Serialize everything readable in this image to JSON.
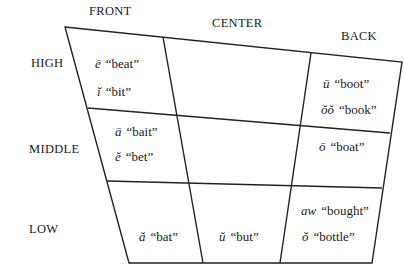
{
  "diagram": {
    "type": "vowel-chart",
    "column_labels": {
      "front": "FRONT",
      "center": "CENTER",
      "back": "BACK"
    },
    "row_labels": {
      "high": "HIGH",
      "middle": "MIDDLE",
      "low": "LOW"
    },
    "cells": {
      "high_front": [
        {
          "symbol": "ē",
          "word": "beat"
        },
        {
          "symbol": "ĭ",
          "word": "bit"
        }
      ],
      "high_center": [],
      "high_back": [
        {
          "symbol": "ū",
          "word": "boot"
        },
        {
          "symbol": "ŏŏ",
          "word": "book"
        }
      ],
      "middle_front": [
        {
          "symbol": "ā",
          "word": "bait"
        },
        {
          "symbol": "ĕ",
          "word": "bet"
        }
      ],
      "middle_center": [],
      "middle_back": [
        {
          "symbol": "ō",
          "word": "boat"
        }
      ],
      "low_front": [
        {
          "symbol": "ă",
          "word": "bat"
        }
      ],
      "low_center": [
        {
          "symbol": "ŭ",
          "word": "but"
        }
      ],
      "low_back": [
        {
          "symbol": "aw",
          "word": "bought"
        },
        {
          "symbol": "ŏ",
          "word": "bottle"
        }
      ]
    },
    "colors": {
      "line": "#222222",
      "text": "#1a1a1a",
      "background": "#ffffff"
    }
  }
}
